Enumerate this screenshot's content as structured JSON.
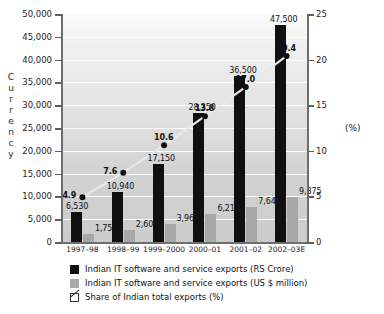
{
  "chart_data": {
    "type": "bar",
    "title": "",
    "subtitle": "",
    "xlabel": "",
    "ylabel": "Currency",
    "y2label": "(%)",
    "ylim": [
      0,
      50000
    ],
    "y2lim": [
      0,
      25
    ],
    "grid": true,
    "legend_position": "bottom-left",
    "categories": [
      "1997–98",
      "1998–99",
      "1999–2000",
      "2000–01",
      "2001–02",
      "2002–03E"
    ],
    "yticks": [
      "0",
      "5,000",
      "10,000",
      "15,000",
      "20,000",
      "25,000",
      "30,000",
      "35,000",
      "40,000",
      "45,000",
      "50,000"
    ],
    "ytick_values": [
      0,
      5000,
      10000,
      15000,
      20000,
      25000,
      30000,
      35000,
      40000,
      45000,
      50000
    ],
    "y2ticks": [
      "0",
      "5",
      "10",
      "15",
      "20",
      "25"
    ],
    "y2tick_values": [
      0,
      5,
      10,
      15,
      20,
      25
    ],
    "series": [
      {
        "name": "Indian IT software and service exports (RS Crore)",
        "type": "bar",
        "axis": "left",
        "color": "#101010",
        "values": [
          6530,
          10940,
          17150,
          28350,
          36500,
          47500
        ],
        "labels": [
          "6,530",
          "10,940",
          "17,150",
          "28,350",
          "36,500",
          "47,500"
        ]
      },
      {
        "name": "Indian IT software and service exports (US $ million)",
        "type": "bar",
        "axis": "left",
        "color": "#a8a8a8",
        "values": [
          1759,
          2600,
          3962,
          6217,
          7647,
          9875
        ],
        "labels": [
          "1,759",
          "2,600",
          "3,962",
          "6,217",
          "7,647",
          "9,875"
        ]
      },
      {
        "name": "Share of Indian total exports (%)",
        "type": "line",
        "axis": "right",
        "color": "#101010",
        "values": [
          4.9,
          7.6,
          10.6,
          13.8,
          17.0,
          20.4
        ],
        "labels": [
          "4.9",
          "7.6",
          "10.6",
          "13.8",
          "17.0",
          "20.4"
        ]
      }
    ]
  },
  "legend": {
    "items": [
      {
        "swatch": "black-square",
        "label": "Indian IT software and service exports (RS Crore)"
      },
      {
        "swatch": "gray-square",
        "label": "Indian IT software and service exports (US $ million)"
      },
      {
        "swatch": "line-marker",
        "label": "Share of Indian total exports (%)"
      }
    ]
  },
  "axes": {
    "left_title_letters": [
      "C",
      "u",
      "r",
      "r",
      "e",
      "n",
      "c",
      "y"
    ],
    "right_unit": "(%)"
  }
}
